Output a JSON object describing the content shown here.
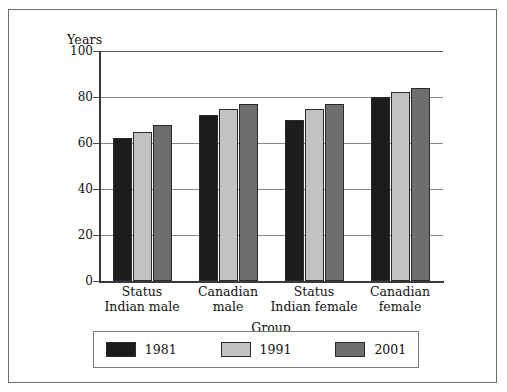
{
  "chart_data": {
    "type": "bar",
    "title": "",
    "xlabel": "Group",
    "ylabel": "Years",
    "ylim": [
      0,
      100
    ],
    "yticks": [
      0,
      20,
      40,
      60,
      80,
      100
    ],
    "ytick_labels": [
      "0",
      "20",
      "40",
      "60",
      "80",
      "100"
    ],
    "grid": true,
    "legend_position": "bottom",
    "categories": [
      "Status\nIndian male",
      "Canadian\nmale",
      "Status\nIndian female",
      "Canadian\nfemale"
    ],
    "category_lines": [
      [
        "Status",
        "Indian male"
      ],
      [
        "Canadian",
        "male"
      ],
      [
        "Status",
        "Indian female"
      ],
      [
        "Canadian",
        "female"
      ]
    ],
    "series": [
      {
        "name": "1981",
        "color": "#1c1c1c",
        "values": [
          62,
          72,
          70,
          80
        ]
      },
      {
        "name": "1991",
        "color": "#c3c3c3",
        "values": [
          65,
          75,
          75,
          82
        ]
      },
      {
        "name": "2001",
        "color": "#6e6e6e",
        "values": [
          68,
          77,
          77,
          84
        ]
      }
    ]
  },
  "axes": {
    "y_title": "Years",
    "x_title": "Group"
  },
  "legend": {
    "entries": [
      {
        "label": "1981",
        "color": "#1c1c1c"
      },
      {
        "label": "1991",
        "color": "#c3c3c3"
      },
      {
        "label": "2001",
        "color": "#6e6e6e"
      }
    ]
  },
  "colors": {
    "frame": "#6d6d6d",
    "axis": "#3b3b3b",
    "gridline": "#5d5d5d",
    "bar_outline": "#2a2a2a",
    "background": "#ffffff"
  }
}
